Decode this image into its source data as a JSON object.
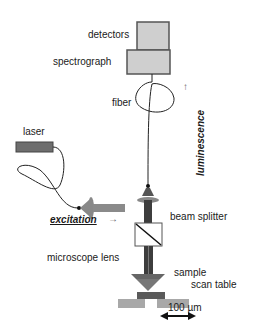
{
  "diagram": {
    "type": "confocal micro-photoluminescence setup",
    "labels": {
      "detectors": "detectors",
      "spectrograph": "spectrograph",
      "fiber": "fiber",
      "luminescence": "luminescence",
      "laser": "laser",
      "excitation": "excitation",
      "beam_splitter": "beam splitter",
      "microscope_lens": "microscope lens",
      "sample": "sample",
      "scan_table": "scan table",
      "scale": "100 µm"
    },
    "arrows": {
      "excitation_arrow": "→",
      "luminescence_arrow": "↑"
    },
    "colors": {
      "box_fill": "#cfcfcf",
      "box_stroke": "#555555",
      "beam": "#444444",
      "laser_fill": "#6e6e6e",
      "excitation_beam": "#8a8a8a",
      "lens_fill": "#777777",
      "sample_fill": "#5a5a5a",
      "table_fill": "#a8a8a8"
    }
  }
}
